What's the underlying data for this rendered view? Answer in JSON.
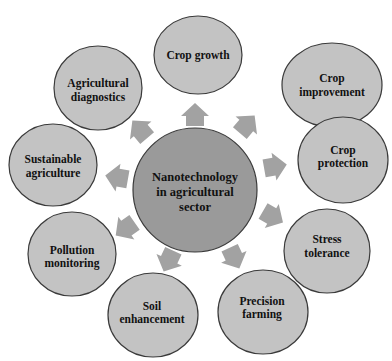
{
  "diagram": {
    "title": "Nanotechnology in agricultural sector",
    "colors": {
      "background": "#ffffff",
      "center_fill": "#9a9a9a",
      "node_fill": "#c3c3c3",
      "stroke": "#3a3a3a",
      "arrow_fill": "#a2a2a2",
      "text": "#111111"
    },
    "center": {
      "line1": "Nanotechnology",
      "line2": "in agricultural",
      "line3": "sector"
    },
    "nodes": [
      {
        "id": "crop-growth",
        "line1": "Crop growth",
        "line2": ""
      },
      {
        "id": "crop-improvement",
        "line1": "Crop",
        "line2": "improvement"
      },
      {
        "id": "crop-protection",
        "line1": "Crop",
        "line2": "protection"
      },
      {
        "id": "stress-tolerance",
        "line1": "Stress",
        "line2": "tolerance"
      },
      {
        "id": "precision-farming",
        "line1": "Precision",
        "line2": "farming"
      },
      {
        "id": "soil-enhancement",
        "line1": "Soil",
        "line2": "enhancement"
      },
      {
        "id": "pollution-monitoring",
        "line1": "Pollution",
        "line2": "monitoring"
      },
      {
        "id": "sustainable-agriculture",
        "line1": "Sustainable",
        "line2": "agriculture"
      },
      {
        "id": "agricultural-diagnostics",
        "line1": "Agricultural",
        "line2": "diagnostics"
      }
    ]
  }
}
